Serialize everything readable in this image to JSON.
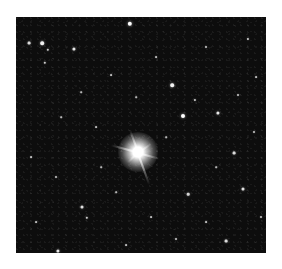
{
  "image": {
    "kind": "astronomical star field photograph",
    "background_color": "#ffffff",
    "field_color": "#0d0d0d",
    "field_bounds": {
      "x": 16,
      "y": 17,
      "width": 250,
      "height": 236
    }
  },
  "bright_star": {
    "x": 122,
    "y": 135,
    "spikes": [
      {
        "angle": 70,
        "length": 34
      },
      {
        "angle": 250,
        "length": 24
      },
      {
        "angle": 195,
        "length": 28
      },
      {
        "angle": 15,
        "length": 22
      },
      {
        "angle": 325,
        "length": 16
      },
      {
        "angle": 135,
        "length": 14
      }
    ]
  },
  "stars": [
    {
      "x": 114,
      "y": 7,
      "r": 2.2
    },
    {
      "x": 26,
      "y": 26,
      "r": 1.8
    },
    {
      "x": 13,
      "y": 26,
      "r": 1.4
    },
    {
      "x": 58,
      "y": 32,
      "r": 1.6
    },
    {
      "x": 32,
      "y": 33,
      "r": 1.2
    },
    {
      "x": 29,
      "y": 46,
      "r": 1.2
    },
    {
      "x": 156,
      "y": 68,
      "r": 1.8
    },
    {
      "x": 167,
      "y": 99,
      "r": 2.0
    },
    {
      "x": 202,
      "y": 96,
      "r": 1.6
    },
    {
      "x": 179,
      "y": 83,
      "r": 1.1
    },
    {
      "x": 218,
      "y": 136,
      "r": 1.4
    },
    {
      "x": 66,
      "y": 190,
      "r": 1.5
    },
    {
      "x": 71,
      "y": 201,
      "r": 1.2
    },
    {
      "x": 42,
      "y": 234,
      "r": 1.6
    },
    {
      "x": 172,
      "y": 177,
      "r": 1.3
    },
    {
      "x": 227,
      "y": 172,
      "r": 1.5
    },
    {
      "x": 210,
      "y": 224,
      "r": 1.4
    },
    {
      "x": 95,
      "y": 58,
      "r": 0.9
    },
    {
      "x": 140,
      "y": 40,
      "r": 0.9
    },
    {
      "x": 190,
      "y": 30,
      "r": 1.0
    },
    {
      "x": 232,
      "y": 22,
      "r": 1.1
    },
    {
      "x": 240,
      "y": 60,
      "r": 0.9
    },
    {
      "x": 222,
      "y": 78,
      "r": 1.0
    },
    {
      "x": 120,
      "y": 80,
      "r": 0.8
    },
    {
      "x": 80,
      "y": 110,
      "r": 0.9
    },
    {
      "x": 45,
      "y": 100,
      "r": 0.8
    },
    {
      "x": 15,
      "y": 140,
      "r": 0.9
    },
    {
      "x": 40,
      "y": 160,
      "r": 1.0
    },
    {
      "x": 100,
      "y": 175,
      "r": 0.8
    },
    {
      "x": 135,
      "y": 200,
      "r": 0.9
    },
    {
      "x": 160,
      "y": 222,
      "r": 1.0
    },
    {
      "x": 190,
      "y": 205,
      "r": 0.9
    },
    {
      "x": 238,
      "y": 115,
      "r": 1.0
    },
    {
      "x": 150,
      "y": 120,
      "r": 0.8
    },
    {
      "x": 85,
      "y": 150,
      "r": 0.8
    },
    {
      "x": 20,
      "y": 205,
      "r": 0.9
    },
    {
      "x": 110,
      "y": 228,
      "r": 0.9
    },
    {
      "x": 245,
      "y": 200,
      "r": 1.0
    },
    {
      "x": 65,
      "y": 75,
      "r": 0.8
    },
    {
      "x": 200,
      "y": 150,
      "r": 0.8
    }
  ]
}
